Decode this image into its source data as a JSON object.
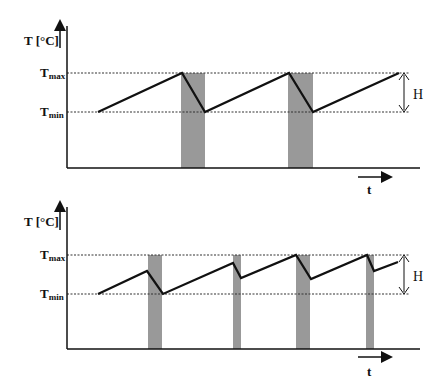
{
  "diagram": {
    "type": "temperature-time sawtooth comparison",
    "panels": [
      {
        "id": "top",
        "y_axis_label": "T [°C]",
        "x_axis_label": "t",
        "t_max_label": "T",
        "t_max_sub": "max",
        "t_min_label": "T",
        "t_min_sub": "min",
        "band_label": "H",
        "description": "Temperature rises from Tmin to Tmax, then drops to Tmin during shaded (active) periods; 2 shaded periods"
      },
      {
        "id": "bottom",
        "y_axis_label": "T [°C]",
        "x_axis_label": "t",
        "t_max_label": "T",
        "t_max_sub": "max",
        "t_min_label": "T",
        "t_min_sub": "min",
        "band_label": "H",
        "description": "Shorter, more frequent shaded periods; temperature oscillates within smaller range; 4 shaded periods"
      }
    ],
    "colors": {
      "line": "#111111",
      "shade": "#999999",
      "dotted": "#333333"
    }
  }
}
